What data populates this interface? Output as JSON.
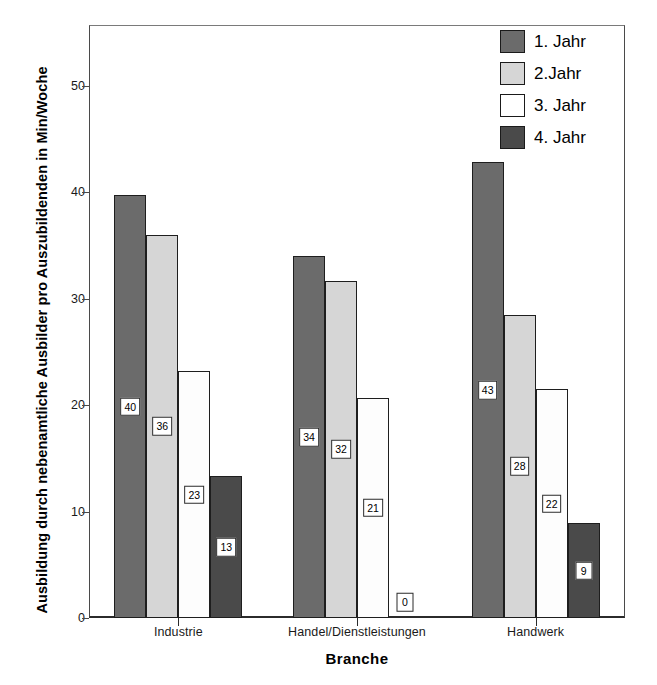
{
  "chart_data": {
    "type": "bar",
    "title": "",
    "xlabel": "Branche",
    "ylabel": "Ausbildung durch nebenamtliche Ausbilder pro Auszubildenden in Min/Woche",
    "categories": [
      "Industrie",
      "Handel/Dienstleistungen",
      "Handwerk"
    ],
    "series": [
      {
        "name": "1. Jahr",
        "color": "#6b6b6b",
        "values": [
          39.7,
          34.0,
          42.8
        ],
        "labels": [
          "40",
          "34",
          "43"
        ]
      },
      {
        "name": "2.Jahr",
        "color": "#d6d6d6",
        "values": [
          36.0,
          31.7,
          28.5
        ],
        "labels": [
          "36",
          "32",
          "28"
        ]
      },
      {
        "name": "3. Jahr",
        "color": "#ffffff",
        "values": [
          23.2,
          20.7,
          21.5
        ],
        "labels": [
          "23",
          "21",
          "22"
        ]
      },
      {
        "name": "4. Jahr",
        "color": "#4a4a4a",
        "values": [
          13.3,
          0,
          8.9
        ],
        "labels": [
          "13",
          "0",
          "9"
        ]
      }
    ],
    "yticks": [
      0,
      10,
      20,
      30,
      40,
      50
    ],
    "ylim": [
      0,
      55.7
    ],
    "grid": false,
    "legend_position": "top-right"
  },
  "axes": {
    "y_title": "Ausbildung durch nebenamtliche Ausbilder pro Auszubildenden in Min/Woche",
    "x_title": "Branche"
  },
  "legend": {
    "items": [
      {
        "label": "1. Jahr",
        "swatch": "legend-swatch-1-jahr"
      },
      {
        "label": "2.Jahr",
        "swatch": "legend-swatch-2-jahr"
      },
      {
        "label": "3. Jahr",
        "swatch": "legend-swatch-3-jahr"
      },
      {
        "label": "4. Jahr",
        "swatch": "legend-swatch-4-jahr"
      }
    ]
  }
}
